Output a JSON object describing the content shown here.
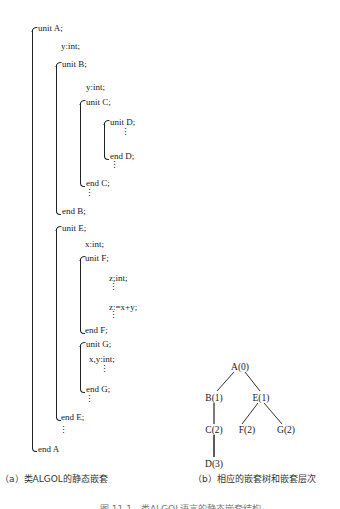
{
  "panel_a": {
    "caption": "（a）类ALGOL的静态嵌套",
    "lines": {
      "unit_a": "unit A;",
      "a_decl": "y:int;",
      "unit_b": "unit B;",
      "b_decl": "y:int;",
      "unit_c": "unit C;",
      "unit_d": "unit D;",
      "end_d": "end D;",
      "end_c": "end C;",
      "end_b": "end B;",
      "unit_e": "unit E;",
      "e_decl": "x:int;",
      "unit_f": "unit F;",
      "f_decl": "z;int;",
      "f_stmt": "z:=x+y;",
      "end_f": "end F;",
      "unit_g": "unit G;",
      "g_decl": "x,y:int;",
      "end_g": "end G;",
      "end_e": "end E;",
      "end_a": "end A"
    },
    "ellipsis": "⋮"
  },
  "panel_b": {
    "caption": "（b）相应的嵌套树和嵌套层次",
    "nodes": {
      "a": "A(0)",
      "b": "B(1)",
      "e": "E(1)",
      "c": "C(2)",
      "f": "F(2)",
      "g": "G(2)",
      "d": "D(3)"
    },
    "edges": [
      [
        "A(0)",
        "B(1)"
      ],
      [
        "A(0)",
        "E(1)"
      ],
      [
        "B(1)",
        "C(2)"
      ],
      [
        "C(2)",
        "D(3)"
      ],
      [
        "E(1)",
        "F(2)"
      ],
      [
        "E(1)",
        "G(2)"
      ]
    ]
  },
  "figure_caption": "图 11.1　类ALGOL语言的静态嵌套结构"
}
